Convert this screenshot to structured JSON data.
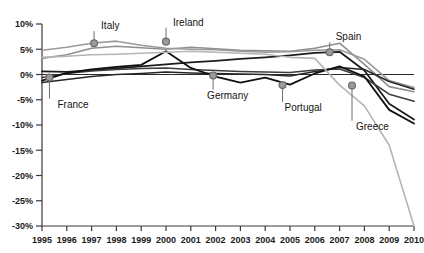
{
  "chart_data": {
    "type": "line",
    "title": "",
    "subtitle": "",
    "xlabel": "",
    "ylabel": "",
    "xlim": [
      1995,
      2010
    ],
    "ylim": [
      -30,
      10
    ],
    "grid": false,
    "legend_position": "inline-callouts",
    "x": [
      1995,
      1996,
      1997,
      1998,
      1999,
      2000,
      2001,
      2002,
      2003,
      2004,
      2005,
      2006,
      2007,
      2008,
      2009,
      2010
    ],
    "y_ticks": [
      10,
      5,
      0,
      -5,
      -10,
      -15,
      -20,
      -25,
      -30
    ],
    "y_tick_labels": [
      "10%",
      "5%",
      "0%",
      "-5%",
      "-10%",
      "-15%",
      "-20%",
      "-25%",
      "-30%"
    ],
    "x_tick_labels": [
      "1995",
      "1996",
      "1997",
      "1998",
      "1999",
      "2000",
      "2001",
      "2002",
      "2003",
      "2004",
      "2005",
      "2006",
      "2007",
      "2008",
      "2009",
      "2010"
    ],
    "series": [
      {
        "name": "Ireland",
        "color": "#8f8f8f",
        "width": 1.6,
        "values": [
          3.2,
          3.9,
          5.2,
          5.6,
          5.3,
          5.0,
          5.4,
          5.1,
          4.8,
          4.7,
          4.6,
          5.2,
          6.2,
          2.0,
          -2.4,
          -3.4
        ]
      },
      {
        "name": "Italy",
        "color": "#9a9a9a",
        "width": 1.6,
        "values": [
          4.8,
          5.4,
          6.2,
          6.6,
          5.8,
          5.2,
          5.0,
          4.9,
          4.6,
          4.4,
          4.5,
          4.8,
          4.9,
          3.0,
          -1.2,
          -2.6
        ]
      },
      {
        "name": "Spain",
        "color": "#1c1c1c",
        "width": 1.8,
        "values": [
          0.6,
          0.5,
          0.8,
          1.2,
          1.6,
          2.0,
          2.4,
          2.7,
          3.1,
          3.4,
          3.8,
          4.3,
          4.5,
          0.8,
          -5.8,
          -8.9
        ]
      },
      {
        "name": "Germany",
        "color": "#262626",
        "width": 1.6,
        "values": [
          -1.6,
          -1.0,
          -0.4,
          0.0,
          0.2,
          0.5,
          0.3,
          0.2,
          0.1,
          0.0,
          -0.3,
          0.6,
          1.4,
          1.0,
          -1.4,
          -2.9
        ]
      },
      {
        "name": "France",
        "color": "#3d3d3d",
        "width": 1.6,
        "values": [
          -0.6,
          0.2,
          0.7,
          1.0,
          1.2,
          1.3,
          1.0,
          0.8,
          0.6,
          0.5,
          0.4,
          0.9,
          1.1,
          -0.6,
          -3.9,
          -5.3
        ]
      },
      {
        "name": "Portugal",
        "color": "#111111",
        "width": 1.8,
        "values": [
          -1.2,
          0.3,
          1.0,
          1.5,
          1.9,
          4.6,
          1.3,
          -0.4,
          -1.6,
          -0.6,
          -2.0,
          0.2,
          1.6,
          -0.4,
          -7.0,
          -9.7
        ]
      },
      {
        "name": "Greece",
        "color": "#b5b5b5",
        "width": 1.6,
        "values": [
          3.4,
          3.6,
          3.9,
          4.0,
          4.2,
          4.4,
          4.6,
          4.4,
          4.2,
          4.0,
          3.4,
          3.2,
          -2.1,
          -6.2,
          -14.0,
          -30.0
        ]
      }
    ],
    "annotations": [
      {
        "label": "France",
        "marker_x": 1995.3,
        "marker_y": -0.6,
        "label_dx": 8,
        "label_dy": 30
      },
      {
        "label": "Italy",
        "marker_x": 1997.1,
        "marker_y": 6.2,
        "label_dx": 7,
        "label_dy": -14
      },
      {
        "label": "Ireland",
        "marker_x": 2000.0,
        "marker_y": 6.5,
        "label_dx": 7,
        "label_dy": -16
      },
      {
        "label": "Germany",
        "marker_x": 2001.9,
        "marker_y": -0.2,
        "label_dx": -6,
        "label_dy": 23
      },
      {
        "label": "Portugal",
        "marker_x": 2004.7,
        "marker_y": -2.1,
        "label_dx": 2,
        "label_dy": 26
      },
      {
        "label": "Spain",
        "marker_x": 2006.6,
        "marker_y": 4.4,
        "label_dx": 6,
        "label_dy": -12
      },
      {
        "label": "Greece",
        "marker_x": 2007.5,
        "marker_y": -2.2,
        "label_dx": 4,
        "label_dy": 44
      }
    ]
  },
  "axes": {
    "y_axis_name": "percent-axis",
    "x_axis_name": "year-axis"
  }
}
